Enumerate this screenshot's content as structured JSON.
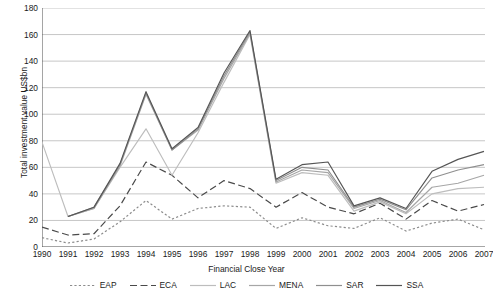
{
  "chart_data": {
    "type": "line",
    "title": "",
    "xlabel": "Financial Close Year",
    "ylabel": "Total investment value US$bn",
    "ylim": [
      0,
      180
    ],
    "ytick_step": 20,
    "yticks": [
      0,
      20,
      40,
      60,
      80,
      100,
      120,
      140,
      160,
      180
    ],
    "grid": true,
    "legend_position": "bottom",
    "categories": [
      "1990",
      "1991",
      "1992",
      "1993",
      "1994",
      "1995",
      "1996",
      "1997",
      "1998",
      "1999",
      "2000",
      "2001",
      "2002",
      "2003",
      "2004",
      "2005",
      "2006",
      "2007"
    ],
    "series": [
      {
        "name": "EAP",
        "color": "#8c8c8c",
        "dash": "dotted",
        "values": [
          7,
          3,
          6,
          19,
          35,
          21,
          29,
          31,
          30,
          14,
          22,
          16,
          14,
          22,
          12,
          18,
          21,
          13
        ]
      },
      {
        "name": "ECA",
        "color": "#4a4a4a",
        "dash": "dashed",
        "values": [
          15,
          9,
          10,
          31,
          64,
          54,
          37,
          50,
          44,
          30,
          41,
          30,
          25,
          33,
          21,
          35,
          27,
          32
        ]
      },
      {
        "name": "LAC",
        "color": "#bdbdbd",
        "dash": "solid",
        "values": [
          79,
          23,
          29,
          60,
          89,
          54,
          86,
          124,
          160,
          48,
          56,
          54,
          27,
          34,
          25,
          40,
          44,
          45
        ]
      },
      {
        "name": "MENA",
        "color": "#a6a6a6",
        "dash": "solid",
        "values": [
          null,
          23,
          29,
          61,
          115,
          73,
          88,
          127,
          161,
          49,
          58,
          56,
          29,
          35,
          26,
          45,
          48,
          54
        ]
      },
      {
        "name": "SAR",
        "color": "#8f8f8f",
        "dash": "solid",
        "values": [
          null,
          23,
          30,
          62,
          116,
          73,
          89,
          129,
          162,
          50,
          60,
          58,
          30,
          36,
          28,
          52,
          58,
          62
        ]
      },
      {
        "name": "SSA",
        "color": "#555555",
        "dash": "solid",
        "values": [
          null,
          23,
          30,
          63,
          117,
          74,
          90,
          131,
          163,
          51,
          62,
          64,
          31,
          37,
          29,
          57,
          66,
          72
        ]
      }
    ]
  },
  "legend": {
    "items": [
      {
        "label": "EAP"
      },
      {
        "label": "ECA"
      },
      {
        "label": "LAC"
      },
      {
        "label": "MENA"
      },
      {
        "label": "SAR"
      },
      {
        "label": "SSA"
      }
    ]
  }
}
